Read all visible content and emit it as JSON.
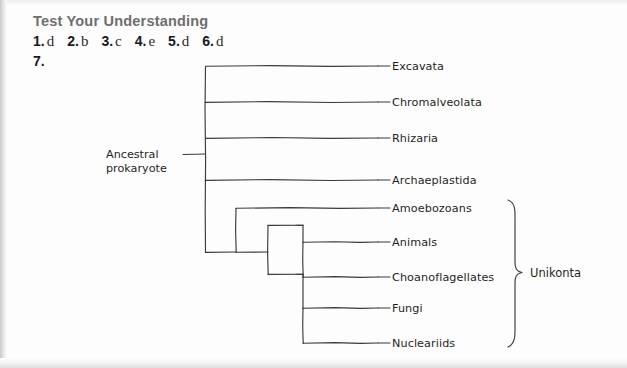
{
  "header": {
    "title": "Test Your Understanding",
    "answers": [
      {
        "num": "1.",
        "value": "d"
      },
      {
        "num": "2.",
        "value": "b"
      },
      {
        "num": "3.",
        "value": "c"
      },
      {
        "num": "4.",
        "value": "e"
      },
      {
        "num": "5.",
        "value": "d"
      },
      {
        "num": "6.",
        "value": "d"
      }
    ],
    "question7_num": "7."
  },
  "diagram": {
    "type": "phylogenetic-tree",
    "root_label_line1": "Ancestral",
    "root_label_line2": "prokaryote",
    "group_bracket_label": "Unikonta",
    "taxa": [
      {
        "name": "Excavata",
        "y": 66
      },
      {
        "name": "Chromalveolata",
        "y": 102
      },
      {
        "name": "Rhizaria",
        "y": 138
      },
      {
        "name": "Archaeplastida",
        "y": 180
      },
      {
        "name": "Amoebozoans",
        "y": 208
      },
      {
        "name": "Animals",
        "y": 242
      },
      {
        "name": "Choanoflagellates",
        "y": 277
      },
      {
        "name": "Fungi",
        "y": 308
      },
      {
        "name": "Nucleariids",
        "y": 343
      }
    ],
    "bracket_members": [
      "Amoebozoans",
      "Animals",
      "Choanoflagellates",
      "Fungi",
      "Nucleariids"
    ],
    "ink_color": "#3a3a3a",
    "text_color": "#1f1f1f"
  }
}
